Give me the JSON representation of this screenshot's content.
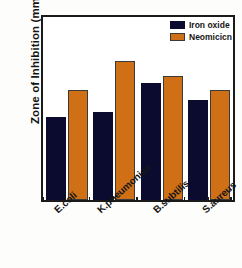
{
  "chart_data": {
    "type": "bar",
    "title": "",
    "xlabel": "",
    "ylabel": "Zone of Inhibition (mm)",
    "ylim": [
      0,
      25
    ],
    "ytick_labels": [
      "0",
      "5",
      "10",
      "15",
      "20",
      "25"
    ],
    "ytick_values": [
      0,
      5,
      10,
      15,
      20,
      25
    ],
    "yminor_values": [
      2.5,
      7.5,
      12.5,
      17.5,
      22.5
    ],
    "grid": false,
    "legend_position": "top-right-inside",
    "categories": [
      "E.coli",
      "K.pneumoniae",
      "B.subtilis",
      "S.aureus"
    ],
    "series": [
      {
        "name": "Iron oxide",
        "color": "#0b0b2f",
        "values": [
          11.3,
          12.0,
          16.0,
          13.7
        ]
      },
      {
        "name": "Neomicicn",
        "color": "#cf7016",
        "values": [
          15.0,
          19.0,
          17.0,
          15.0
        ]
      }
    ]
  },
  "legend": {
    "items": [
      {
        "label": "Iron oxide",
        "swatch": "navy"
      },
      {
        "label": "Neomicicn",
        "swatch": "orange"
      }
    ]
  },
  "axes": {
    "y_title": "Zone of Inhibition (mm)"
  }
}
